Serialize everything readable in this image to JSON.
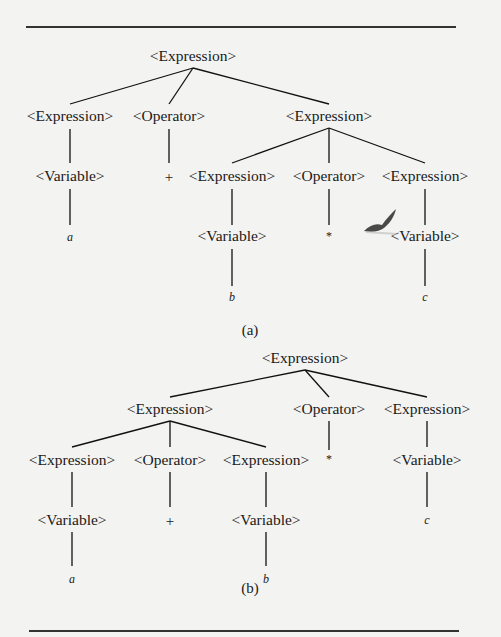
{
  "figure": {
    "tree_a": {
      "caption": "(a)",
      "root": "<Expression>",
      "level1": [
        "<Expression>",
        "<Operator>",
        "<Expression>"
      ],
      "level2": [
        "<Variable>",
        "+",
        "<Expression>",
        "<Operator>",
        "<Expression>"
      ],
      "level3": [
        "a",
        "<Variable>",
        "*",
        "<Variable>"
      ],
      "level4": [
        "b",
        "c"
      ]
    },
    "tree_b": {
      "caption": "(b)",
      "root": "<Expression>",
      "level1": [
        "<Expression>",
        "<Operator>",
        "<Expression>"
      ],
      "level2": [
        "<Expression>",
        "<Operator>",
        "<Expression>",
        "*",
        "<Variable>"
      ],
      "level3": [
        "<Variable>",
        "+",
        "<Variable>",
        "c"
      ],
      "level4": [
        "a",
        "b"
      ]
    }
  }
}
